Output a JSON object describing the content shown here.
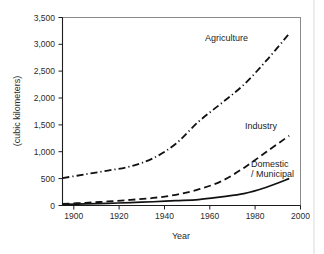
{
  "chart_data": {
    "type": "line",
    "title": "",
    "subtitle": "",
    "xlabel": "Year",
    "ylabel": "(cubic kilometers)",
    "xlim": [
      1900,
      2005
    ],
    "ylim": [
      0,
      3500
    ],
    "grid": false,
    "legend_position": "inline-annotations",
    "xticks": [
      1900,
      1920,
      1940,
      1960,
      1980,
      2000
    ],
    "xtick_labels": [
      "1900",
      "1920",
      "1940",
      "1960",
      "1980",
      "2000"
    ],
    "yticks": [
      0,
      500,
      1000,
      1500,
      2000,
      2500,
      3000,
      3500
    ],
    "ytick_labels": [
      "0",
      "500",
      "1,000",
      "1,500",
      "2,000",
      "2,500",
      "3,000",
      "3,500"
    ],
    "x": [
      1900,
      1910,
      1920,
      1930,
      1940,
      1950,
      1960,
      1970,
      1980,
      1990,
      2000
    ],
    "series": [
      {
        "name": "Agriculture",
        "line_style": "dash-dot",
        "color": "#111111",
        "values": [
          510,
          580,
          650,
          730,
          880,
          1150,
          1560,
          1900,
          2250,
          2700,
          3200
        ]
      },
      {
        "name": "Industry",
        "line_style": "dashed",
        "color": "#111111",
        "values": [
          30,
          50,
          75,
          105,
          140,
          200,
          300,
          450,
          700,
          1000,
          1300
        ]
      },
      {
        "name": "Domestic / Municipal",
        "line_style": "solid",
        "color": "#111111",
        "values": [
          20,
          30,
          40,
          55,
          70,
          90,
          110,
          160,
          220,
          340,
          500
        ]
      }
    ],
    "annotations": [
      {
        "text": "Agriculture",
        "x": 1977,
        "y": 3120
      },
      {
        "text": "Industry",
        "x": 1982,
        "y": 1560
      },
      {
        "text": "Domestic",
        "x": 1985,
        "y": 840
      },
      {
        "text": "/ Municipal",
        "x": 1985,
        "y": 680
      }
    ]
  },
  "axes": {
    "x_title": "Year",
    "y_title": "(cubic kilometers)"
  },
  "labels": {
    "agriculture": "Agriculture",
    "industry": "Industry",
    "domestic_line1": "Domestic",
    "domestic_line2": "/ Municipal"
  },
  "ytick_text": {
    "t0": "0",
    "t500": "500",
    "t1000": "1,000",
    "t1500": "1,500",
    "t2000": "2,000",
    "t2500": "2,500",
    "t3000": "3,000",
    "t3500": "3,500"
  },
  "xtick_text": {
    "t1900": "1900",
    "t1920": "1920",
    "t1940": "1940",
    "t1960": "1960",
    "t1980": "1980",
    "t2000": "2000"
  },
  "colors": {
    "ink": "#111111",
    "frame": "#8a8a8a",
    "background": "#ffffff"
  }
}
